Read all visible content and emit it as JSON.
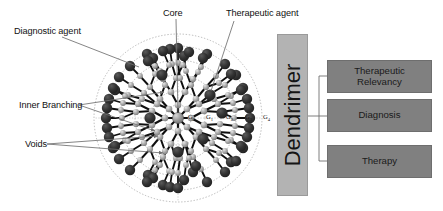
{
  "figure": {
    "type": "schematic-diagram",
    "background_color": "#ffffff"
  },
  "callouts": [
    {
      "id": "diagnostic-agent",
      "label": "Diagnostic agent",
      "x": 14,
      "y": 27
    },
    {
      "id": "core",
      "label": "Core",
      "x": 163,
      "y": 9
    },
    {
      "id": "therapeutic-agent",
      "label": "Therapeutic agent",
      "x": 226,
      "y": 9
    },
    {
      "id": "inner-branching",
      "label": "Inner Branching",
      "x": 19,
      "y": 101
    },
    {
      "id": "voids",
      "label": "Voids",
      "x": 25,
      "y": 140
    }
  ],
  "generations": [
    {
      "label": "G",
      "index": "0",
      "x": 188,
      "y": 113
    },
    {
      "label": "G",
      "index": "1",
      "x": 206,
      "y": 113
    },
    {
      "label": "G",
      "index": "2",
      "x": 226,
      "y": 113
    },
    {
      "label": "G",
      "index": "3",
      "x": 245,
      "y": 113
    },
    {
      "label": "G",
      "index": "4",
      "x": 263,
      "y": 113
    }
  ],
  "panel": {
    "source": {
      "label": "Dendrimer",
      "orientation": "vertical",
      "color": "#b3b3b3",
      "x": 277,
      "y": 34,
      "w": 31,
      "h": 162
    },
    "color": "#808080",
    "items": [
      {
        "id": "therapeutic-relevancy",
        "label": "Therapeutic\nRelevancy",
        "line1": "Therapeutic",
        "line2": "Relevancy",
        "x": 327,
        "y": 60,
        "w": 105,
        "h": 33
      },
      {
        "id": "diagnosis",
        "label": "Diagnosis",
        "line1": "Diagnosis",
        "line2": "",
        "x": 327,
        "y": 99,
        "w": 105,
        "h": 33
      },
      {
        "id": "therapy",
        "label": "Therapy",
        "line1": "Therapy",
        "line2": "",
        "x": 327,
        "y": 145,
        "w": 105,
        "h": 33
      }
    ]
  },
  "colors": {
    "sphere_dark": "#2b2b2b",
    "node_gray": "#9d9d9d",
    "core_gray": "#8a8a8a",
    "bond": "#111111",
    "ring_dotted": "#8e8e8e",
    "leader": "#707070",
    "panel_box": "#808080",
    "dendrimer_box": "#b3b3b3"
  }
}
